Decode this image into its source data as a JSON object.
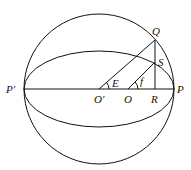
{
  "diagram": {
    "labels": {
      "P_prime": "P′",
      "P": "P",
      "O_prime": "O′",
      "O": "O",
      "R": "R",
      "Q": "Q",
      "S": "S",
      "E": "E",
      "f": "f"
    },
    "stroke_color": "#111111",
    "background": "#ffffff"
  }
}
